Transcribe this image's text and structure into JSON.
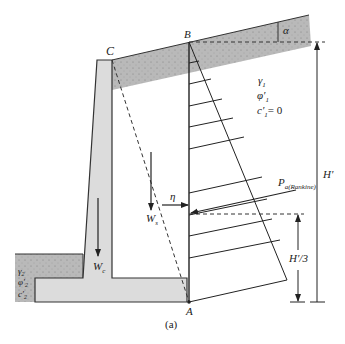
{
  "figure": {
    "caption": "(a)",
    "points": {
      "A": "A",
      "B": "B",
      "C": "C"
    },
    "angle_label": "α",
    "backfill_properties": {
      "gamma": "γ",
      "gamma_sub": "1",
      "phi": "φ′",
      "phi_sub": "1",
      "c": "c′",
      "c_sub": "1",
      "c_value": "= 0"
    },
    "foundation_properties": {
      "gamma": "γ",
      "gamma_sub": "2",
      "phi": "φ′",
      "phi_sub": "2",
      "c": "c′",
      "c_sub": "2"
    },
    "forces": {
      "wall_weight": "W",
      "wall_weight_sub": "c",
      "soil_weight": "W",
      "soil_weight_sub": "s",
      "active_force": "P",
      "active_force_sub": "a(Rankine)",
      "eta": "η"
    },
    "dimensions": {
      "height": "H′",
      "third_height": "H′/3"
    },
    "colors": {
      "wall": "#d9d9d9",
      "soil": "#b8b8b8",
      "line": "#222222"
    }
  }
}
